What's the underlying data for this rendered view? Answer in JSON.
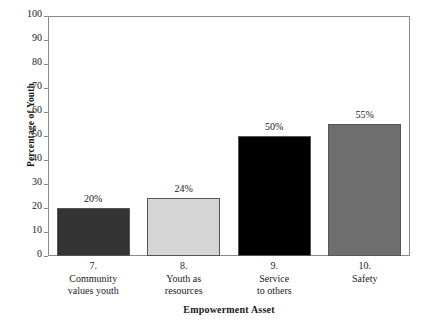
{
  "chart_data": {
    "type": "bar",
    "title": "",
    "xlabel": "Empowerment Asset",
    "ylabel": "Percentage of Youth",
    "ylim": [
      0,
      100
    ],
    "ytick_step": 10,
    "yticks": [
      "100",
      "90",
      "80",
      "70",
      "60",
      "50",
      "40",
      "30",
      "20",
      "10",
      "0"
    ],
    "grid": false,
    "legend": "none",
    "categories": [
      "7. Community values youth",
      "8. Youth as resources",
      "9. Service to others",
      "10. Safety"
    ],
    "category_lines": [
      [
        "7.",
        "Community",
        "values youth"
      ],
      [
        "8.",
        "Youth as",
        "resources"
      ],
      [
        "9.",
        "Service",
        "to others"
      ],
      [
        "10.",
        "Safety"
      ]
    ],
    "values": [
      20,
      24,
      50,
      55
    ],
    "value_labels": [
      "20%",
      "24%",
      "50%",
      "55%"
    ],
    "bar_colors": [
      "#333333",
      "#d5d5d5",
      "#000000",
      "#6e6e6e"
    ],
    "bar_edge_color": "#555555",
    "frame_color": "#8a8a8a",
    "background": "#ffffff"
  }
}
